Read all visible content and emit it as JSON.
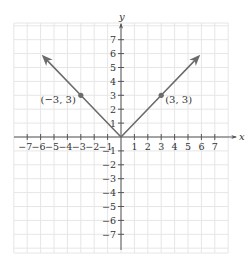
{
  "chart_data": {
    "type": "line",
    "title": "",
    "function": "y = |x|",
    "xlabel": "x",
    "ylabel": "y",
    "xlim": [
      -8,
      8
    ],
    "ylim": [
      -8,
      8
    ],
    "grid": true,
    "x_ticks": [
      -7,
      -6,
      -5,
      -4,
      -3,
      -2,
      -1,
      1,
      2,
      3,
      4,
      5,
      6,
      7
    ],
    "y_ticks": [
      -7,
      -6,
      -5,
      -4,
      -3,
      -2,
      -1,
      1,
      2,
      3,
      4,
      5,
      6,
      7
    ],
    "x_tick_labels": [
      "−7",
      "−6",
      "−5",
      "−4",
      "−3",
      "−2",
      "−1",
      "1",
      "2",
      "3",
      "4",
      "5",
      "6",
      "7"
    ],
    "y_tick_labels": [
      "−7",
      "−6",
      "−5",
      "−4",
      "−3",
      "−2",
      "−1",
      "1",
      "2",
      "3",
      "4",
      "5",
      "6",
      "7"
    ],
    "series": [
      {
        "name": "y = |x|",
        "points": [
          [
            -5.8,
            5.8
          ],
          [
            -3,
            3
          ],
          [
            0,
            0
          ],
          [
            3,
            3
          ],
          [
            5.8,
            5.8
          ]
        ],
        "arrows_at_ends": true
      }
    ],
    "annotations": [
      {
        "x": -3,
        "y": 3,
        "label": "(−3, 3)",
        "marker": "dot"
      },
      {
        "x": 3,
        "y": 3,
        "label": "(3, 3)",
        "marker": "dot"
      }
    ],
    "colors": {
      "line": "#6b6b6b",
      "axis": "#555555",
      "grid": "#e6e6e6",
      "text": "#333333"
    }
  }
}
